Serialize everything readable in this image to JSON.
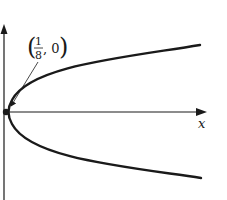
{
  "diagram": {
    "type": "parabola",
    "equation_hint": "y^2 = (1/2) x  (opens right, focus at (1/8, 0))",
    "axes": {
      "x_label": "x",
      "y_label": ""
    },
    "point_label": {
      "open_paren": "(",
      "numerator": "1",
      "denominator": "8",
      "comma_value": ", 0",
      "close_paren": ")",
      "text": "(1/8, 0)"
    },
    "colors": {
      "stroke": "#1a1a1a",
      "background": "#ffffff"
    }
  }
}
